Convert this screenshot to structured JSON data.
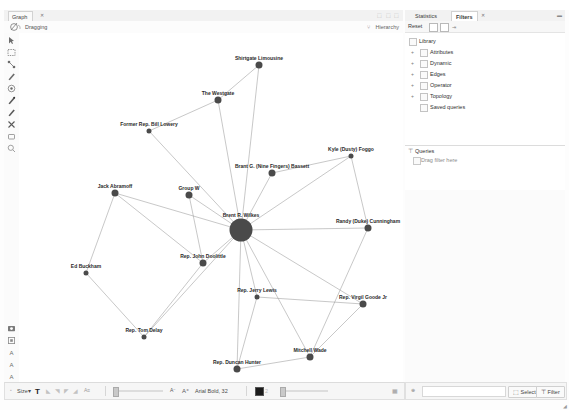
{
  "window": {
    "graph_tab": "Graph",
    "graph_tab_close": "✕",
    "dragging_label": "Dragging",
    "hierarchy_label": "Hierarchy",
    "tabbar_right_glyphs": "⬚ ⬚ ⬚"
  },
  "left_toolbar": {
    "tools": [
      {
        "name": "pointer-tool",
        "glyph": "➤"
      },
      {
        "name": "rectangle-select-tool",
        "glyph": "▭"
      },
      {
        "name": "shortest-path-tool",
        "glyph": "⌇"
      },
      {
        "name": "painter-tool",
        "glyph": "✎"
      },
      {
        "name": "heatmap-tool",
        "glyph": "◉"
      },
      {
        "name": "node-pencil-tool",
        "glyph": "✐"
      },
      {
        "name": "edge-pencil-tool",
        "glyph": "✐"
      },
      {
        "name": "brush-tool",
        "glyph": "✖"
      },
      {
        "name": "eraser-tool",
        "glyph": "◻"
      },
      {
        "name": "magnifier-tool",
        "glyph": "◌"
      }
    ],
    "bottom_tools": [
      {
        "name": "screenshot-tool",
        "glyph": "▣"
      },
      {
        "name": "settings-tool",
        "glyph": "⚙"
      },
      {
        "name": "label-size-a-tool",
        "glyph": "A"
      },
      {
        "name": "label-size-b-tool",
        "glyph": "A"
      },
      {
        "name": "label-size-c-tool",
        "glyph": "A"
      }
    ]
  },
  "right_panel": {
    "tabs": [
      {
        "label": "Statistics",
        "selected": false
      },
      {
        "label": "Filters",
        "selected": true
      }
    ],
    "tab_close": "✕",
    "collapse_glyph": "▬",
    "reset_label": "Reset",
    "arrow_glyph": "⇥",
    "tree": [
      {
        "label": "Library",
        "depth": 0,
        "expander": "",
        "has_icon": true
      },
      {
        "label": "Attributes",
        "depth": 1,
        "expander": "+",
        "has_icon": true
      },
      {
        "label": "Dynamic",
        "depth": 1,
        "expander": "+",
        "has_icon": true
      },
      {
        "label": "Edges",
        "depth": 1,
        "expander": "+",
        "has_icon": true
      },
      {
        "label": "Operator",
        "depth": 1,
        "expander": "+",
        "has_icon": true
      },
      {
        "label": "Topology",
        "depth": 1,
        "expander": "+",
        "has_icon": true
      },
      {
        "label": "Saved queries",
        "depth": 1,
        "expander": "",
        "has_icon": true
      }
    ],
    "queries": {
      "title": "Queries",
      "filter_icon": "⊤",
      "drop_hint": "Drag filter here"
    }
  },
  "bottom_bar_left": {
    "font_icon": "T",
    "font_mode_label": "Size",
    "mode_arrow": "▾",
    "icons": [
      "✦",
      "◣",
      "◢",
      "◸",
      "◹"
    ],
    "scale_label": "A",
    "scale_label2": "A",
    "font_value": "Arial Bold, 32",
    "swatch_label": "2",
    "right_glyph": "▦"
  },
  "bottom_bar_right": {
    "globe_icon": "⊕",
    "select_button": "Select",
    "select_icon": "⬚",
    "filter_button": "Filter",
    "filter_icon": "⊤"
  },
  "graph": {
    "canvas_width": 384,
    "canvas_height": 349,
    "node_color": "#4a4a4a",
    "edge_color": "#9a9a9a",
    "label_color": "#2a2a2a",
    "nodes": [
      {
        "id": "wilkes",
        "label": "Brent R. Wilkes",
        "x": 222,
        "y": 197,
        "r": 11.5,
        "label_dx": 0,
        "label_dy": -15
      },
      {
        "id": "limousine",
        "label": "Shirtgate Limousine",
        "x": 240,
        "y": 32,
        "r": 3.5,
        "label_dx": 0,
        "label_dy": -7
      },
      {
        "id": "westgate",
        "label": "The Westgate",
        "x": 199,
        "y": 67,
        "r": 3.5,
        "label_dx": 0,
        "label_dy": -7
      },
      {
        "id": "lowery",
        "label": "Former Rep. Bill Lowery",
        "x": 130,
        "y": 98,
        "r": 2.5,
        "label_dx": 0,
        "label_dy": -7
      },
      {
        "id": "bassett",
        "label": "Brant G. (Nine Fingers) Bassett",
        "x": 253,
        "y": 140,
        "r": 3.5,
        "label_dx": 0,
        "label_dy": -7
      },
      {
        "id": "foggo",
        "label": "Kyle (Dusty) Foggo",
        "x": 332,
        "y": 123,
        "r": 2.5,
        "label_dx": 0,
        "label_dy": -7
      },
      {
        "id": "abramoff",
        "label": "Jack Abramoff",
        "x": 96,
        "y": 160,
        "r": 3.5,
        "label_dx": 0,
        "label_dy": -7
      },
      {
        "id": "groupw",
        "label": "Group W",
        "x": 170,
        "y": 162,
        "r": 3.5,
        "label_dx": 0,
        "label_dy": -7
      },
      {
        "id": "cunningham",
        "label": "Randy (Duke) Cunningham",
        "x": 349,
        "y": 195,
        "r": 3.5,
        "label_dx": 0,
        "label_dy": -7
      },
      {
        "id": "buckham",
        "label": "Ed Buckham",
        "x": 67,
        "y": 240,
        "r": 2.5,
        "label_dx": 0,
        "label_dy": -7
      },
      {
        "id": "doolittle",
        "label": "Rep. John Doolittle",
        "x": 184,
        "y": 230,
        "r": 3.5,
        "label_dx": 0,
        "label_dy": -7
      },
      {
        "id": "jlewis",
        "label": "Rep. Jerry Lewis",
        "x": 238,
        "y": 264,
        "r": 2.5,
        "label_dx": 0,
        "label_dy": -7
      },
      {
        "id": "goode",
        "label": "Rep. Virgil Goode Jr",
        "x": 344,
        "y": 271,
        "r": 3.5,
        "label_dx": 0,
        "label_dy": -7
      },
      {
        "id": "delay",
        "label": "Rep. Tom Delay",
        "x": 125,
        "y": 304,
        "r": 2.5,
        "label_dx": 0,
        "label_dy": -7
      },
      {
        "id": "wade",
        "label": "Mitchell Wade",
        "x": 291,
        "y": 324,
        "r": 3.5,
        "label_dx": 0,
        "label_dy": -7
      },
      {
        "id": "dhunter",
        "label": "Rep. Duncan Hunter",
        "x": 218,
        "y": 336,
        "r": 3.5,
        "label_dx": 0,
        "label_dy": -7
      }
    ],
    "edges": [
      [
        "wilkes",
        "limousine"
      ],
      [
        "wilkes",
        "westgate"
      ],
      [
        "wilkes",
        "bassett"
      ],
      [
        "wilkes",
        "foggo"
      ],
      [
        "wilkes",
        "groupw"
      ],
      [
        "wilkes",
        "cunningham"
      ],
      [
        "wilkes",
        "doolittle"
      ],
      [
        "wilkes",
        "jlewis"
      ],
      [
        "wilkes",
        "goode"
      ],
      [
        "wilkes",
        "wade"
      ],
      [
        "wilkes",
        "dhunter"
      ],
      [
        "wilkes",
        "lowery"
      ],
      [
        "wilkes",
        "delay"
      ],
      [
        "wilkes",
        "abramoff"
      ],
      [
        "westgate",
        "limousine"
      ],
      [
        "westgate",
        "lowery"
      ],
      [
        "abramoff",
        "buckham"
      ],
      [
        "abramoff",
        "doolittle"
      ],
      [
        "buckham",
        "delay"
      ],
      [
        "delay",
        "doolittle"
      ],
      [
        "bassett",
        "foggo"
      ],
      [
        "groupw",
        "doolittle"
      ],
      [
        "wade",
        "goode"
      ],
      [
        "wade",
        "dhunter"
      ],
      [
        "wade",
        "cunningham"
      ],
      [
        "jlewis",
        "dhunter"
      ],
      [
        "goode",
        "jlewis"
      ],
      [
        "foggo",
        "cunningham"
      ]
    ]
  }
}
